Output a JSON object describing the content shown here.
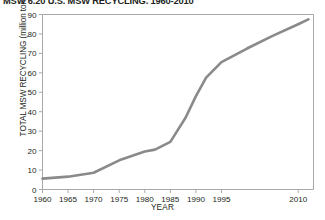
{
  "chart_data": {
    "type": "line",
    "title": "MSW 6.20 U.S. MSW RECYCLING, 1960-2010",
    "xlabel": "YEAR",
    "ylabel": "TOTAL MSW RECYCLING (million tons/yr)",
    "xlim": [
      1960,
      2013
    ],
    "ylim": [
      0,
      90
    ],
    "grid": false,
    "legend": null,
    "xticks": [
      1960,
      1965,
      1970,
      1975,
      1980,
      1985,
      1990,
      1995,
      2010
    ],
    "xtick_labels": [
      "1960",
      "1965",
      "1970",
      "1975",
      "1980",
      "1985",
      "1990",
      "1995",
      "2010"
    ],
    "yticks": [
      0,
      10,
      20,
      30,
      40,
      50,
      60,
      70,
      80,
      90
    ],
    "ytick_labels": [
      "0",
      "10",
      "20",
      "30",
      "40",
      "50",
      "60",
      "70",
      "80",
      "90"
    ],
    "series": [
      {
        "name": "Total MSW recycling",
        "color": "#8a8a8a",
        "x": [
          1960,
          1965,
          1970,
          1975,
          1980,
          1982,
          1985,
          1988,
          1990,
          1992,
          1995,
          2000,
          2005,
          2010,
          2012
        ],
        "values": [
          5.6,
          6.6,
          8.6,
          15.0,
          19.5,
          20.5,
          24.5,
          37.0,
          48.0,
          57.5,
          65.5,
          72.5,
          79.0,
          85.0,
          87.5
        ]
      }
    ]
  },
  "colors": {
    "line": "#8a8a8a",
    "axis": "#a8a8a8",
    "text": "#231f20",
    "background": "#ffffff"
  }
}
